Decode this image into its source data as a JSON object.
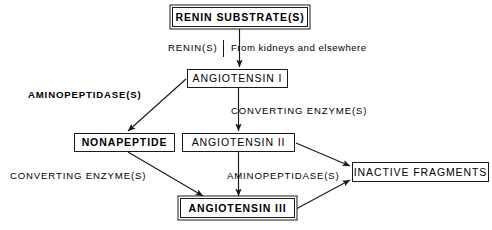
{
  "diagram": {
    "background_color": "#ffffff",
    "line_color": "#1a1a1a",
    "nodes": [
      {
        "id": "renin-substrate",
        "label": "RENIN  SUBSTRATE(S)",
        "x": 172,
        "y": 7,
        "w": 136,
        "h": 20,
        "style": "double"
      },
      {
        "id": "angiotensin-i",
        "label": "ANGIOTENSIN I",
        "x": 187,
        "y": 69,
        "w": 101,
        "h": 19,
        "style": "single"
      },
      {
        "id": "nonapeptide",
        "label": "NONAPEPTIDE",
        "x": 74,
        "y": 133,
        "w": 101,
        "h": 19,
        "style": "bold"
      },
      {
        "id": "angiotensin-ii",
        "label": "ANGIOTENSIN II",
        "x": 182,
        "y": 133,
        "w": 113,
        "h": 19,
        "style": "single"
      },
      {
        "id": "inactive-fragments",
        "label": "INACTIVE  FRAGMENTS",
        "x": 352,
        "y": 162,
        "w": 137,
        "h": 20,
        "style": "single"
      },
      {
        "id": "angiotensin-iii",
        "label": "ANGIOTENSIN III",
        "x": 180,
        "y": 198,
        "w": 115,
        "h": 20,
        "style": "double"
      }
    ],
    "edge_labels": [
      {
        "id": "renin-s",
        "text": "RENIN(S)",
        "x": 168,
        "y": 48
      },
      {
        "id": "from-kidneys",
        "text": "From kidneys and elsewhere",
        "x": 232,
        "y": 48
      },
      {
        "id": "aminopeptidase-left",
        "text": "AMINOPEPTIDASE(S)",
        "x": 28,
        "y": 95
      },
      {
        "id": "converting-enzyme-mid",
        "text": "CONVERTING  ENZYME(S)",
        "x": 232,
        "y": 111
      },
      {
        "id": "converting-enzyme-left",
        "text": "CONVERTING  ENZYME(S)",
        "x": 10,
        "y": 175
      },
      {
        "id": "aminopeptidase-mid",
        "text": "AMINOPEPTIDASE(S)",
        "x": 228,
        "y": 175
      }
    ],
    "edges": [
      {
        "id": "renin-substrate-to-angiotensin-i",
        "from": "renin-substrate",
        "to": "angiotensin-i",
        "label": "RENIN(S)",
        "kind": "vertical"
      },
      {
        "id": "angiotensin-i-to-nonapeptide",
        "from": "angiotensin-i",
        "to": "nonapeptide",
        "label": "AMINOPEPTIDASE(S)",
        "kind": "diagonal"
      },
      {
        "id": "angiotensin-i-to-angiotensin-ii",
        "from": "angiotensin-i",
        "to": "angiotensin-ii",
        "label": "CONVERTING ENZYME(S)",
        "kind": "vertical"
      },
      {
        "id": "nonapeptide-to-angiotensin-iii",
        "from": "nonapeptide",
        "to": "angiotensin-iii",
        "label": "CONVERTING ENZYME(S)",
        "kind": "diagonal"
      },
      {
        "id": "angiotensin-ii-to-angiotensin-iii",
        "from": "angiotensin-ii",
        "to": "angiotensin-iii",
        "label": "AMINOPEPTIDASE(S)",
        "kind": "vertical"
      },
      {
        "id": "angiotensin-ii-to-inactive",
        "from": "angiotensin-ii",
        "to": "inactive-fragments",
        "label": "",
        "kind": "diagonal"
      },
      {
        "id": "angiotensin-iii-to-inactive",
        "from": "angiotensin-iii",
        "to": "inactive-fragments",
        "label": "",
        "kind": "diagonal"
      }
    ]
  }
}
